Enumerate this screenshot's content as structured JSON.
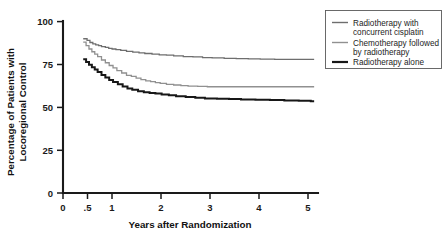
{
  "chart_data": {
    "type": "line",
    "title": "",
    "xlabel": "Years after Randomization",
    "ylabel": "Percentage of Patients with Locoregional Control",
    "ylabel_line1": "Percentage of Patients with",
    "ylabel_line2": "Locoregional Control",
    "xlim": [
      0,
      5.3
    ],
    "ylim": [
      0,
      100
    ],
    "grid": false,
    "legend_position": "top-right",
    "x_ticks": [
      "0",
      ".5",
      "1",
      "2",
      "3",
      "4",
      "5"
    ],
    "x_tick_values": [
      0,
      0.5,
      1,
      2,
      3,
      4,
      5
    ],
    "y_ticks": [
      "0",
      "25",
      "50",
      "75",
      "100"
    ],
    "y_tick_values": [
      0,
      25,
      50,
      75,
      100
    ],
    "series": [
      {
        "name": "Radiotherapy with concurrent cisplatin",
        "color": "#6e6e6e",
        "width": 1.3,
        "x": [
          0.42,
          0.5,
          0.56,
          0.62,
          0.68,
          0.74,
          0.8,
          0.88,
          0.95,
          1.02,
          1.1,
          1.2,
          1.32,
          1.45,
          1.58,
          1.7,
          1.85,
          2.0,
          2.15,
          2.3,
          2.5,
          2.7,
          2.9,
          3.1,
          3.35,
          3.6,
          3.85,
          4.1,
          4.4,
          4.7,
          5.0,
          5.22
        ],
        "y": [
          90.0,
          89.0,
          87.8,
          87.0,
          86.4,
          86.0,
          85.4,
          85.0,
          84.4,
          84.0,
          83.6,
          83.2,
          82.6,
          82.2,
          81.8,
          81.4,
          81.0,
          80.6,
          80.4,
          80.0,
          79.6,
          79.4,
          79.0,
          78.8,
          78.6,
          78.4,
          78.2,
          78.1,
          78.0,
          78.0,
          78.0,
          78.0
        ]
      },
      {
        "name": "Chemotherapy followed by radiotherapy",
        "color": "#909090",
        "width": 1.3,
        "x": [
          0.42,
          0.48,
          0.54,
          0.6,
          0.66,
          0.72,
          0.8,
          0.88,
          0.96,
          1.04,
          1.12,
          1.22,
          1.32,
          1.42,
          1.52,
          1.62,
          1.72,
          1.82,
          1.92,
          2.02,
          2.15,
          2.3,
          2.45,
          2.6,
          2.8,
          3.0,
          3.25,
          3.5,
          3.8,
          4.1,
          4.45,
          4.8,
          5.1,
          5.22
        ],
        "y": [
          88.0,
          86.0,
          84.0,
          82.4,
          81.0,
          79.6,
          77.6,
          76.0,
          74.4,
          73.0,
          71.4,
          70.0,
          68.6,
          68.0,
          67.0,
          66.2,
          65.4,
          65.0,
          64.4,
          64.0,
          63.4,
          63.0,
          62.6,
          62.4,
          62.2,
          62.0,
          62.0,
          62.0,
          62.0,
          62.0,
          62.0,
          62.0,
          62.0,
          62.0
        ]
      },
      {
        "name": "Radiotherapy alone",
        "color": "#171717",
        "width": 2.0,
        "x": [
          0.42,
          0.48,
          0.54,
          0.6,
          0.66,
          0.72,
          0.8,
          0.88,
          0.96,
          1.04,
          1.14,
          1.24,
          1.34,
          1.44,
          1.56,
          1.68,
          1.8,
          1.92,
          2.05,
          2.2,
          2.35,
          2.55,
          2.75,
          2.95,
          3.2,
          3.45,
          3.7,
          4.0,
          4.3,
          4.6,
          4.9,
          5.15,
          5.22
        ],
        "y": [
          78.0,
          76.4,
          74.8,
          73.4,
          72.0,
          70.6,
          68.8,
          67.4,
          66.0,
          64.8,
          63.4,
          62.2,
          61.0,
          60.2,
          59.4,
          58.8,
          58.4,
          58.0,
          57.4,
          57.0,
          56.4,
          56.0,
          55.6,
          55.2,
          55.0,
          54.8,
          54.6,
          54.4,
          54.2,
          54.0,
          53.8,
          53.6,
          53.6
        ]
      }
    ],
    "legend": [
      {
        "label_line1": "Radiotherapy with",
        "label_line2": "concurrent cisplatin",
        "color": "#6e6e6e",
        "width": 1.3
      },
      {
        "label_line1": "Chemotherapy followed",
        "label_line2": "by radiotherapy",
        "color": "#909090",
        "width": 1.3
      },
      {
        "label_line1": "Radiotherapy alone",
        "label_line2": "",
        "color": "#171717",
        "width": 2.0
      }
    ]
  }
}
